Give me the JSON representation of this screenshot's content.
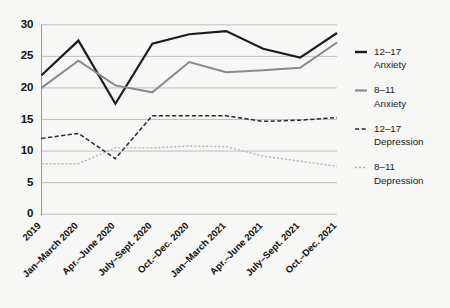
{
  "chart_data": {
    "type": "line",
    "title": "",
    "subtitle": "",
    "xlabel": "",
    "ylabel": "",
    "ylim": [
      0,
      30
    ],
    "yticks": [
      0,
      5,
      10,
      15,
      20,
      25,
      30
    ],
    "grid": true,
    "legend_position": "right",
    "categories": [
      "2019",
      "Jan–March 2020",
      "Apr.–June 2020",
      "July–Sept. 2020",
      "Oct.–Dec. 2020",
      "Jan–March 2021",
      "Apr.–June 2021",
      "July–Sept. 2021",
      "Oct.–Dec. 2021"
    ],
    "series": [
      {
        "name": "12–17 Anxiety",
        "legend_line1": "12–17",
        "legend_line2": "Anxiety",
        "color": "#1c1c1c",
        "style": "solid",
        "width": 2.2,
        "values": [
          22.0,
          27.5,
          17.5,
          27.0,
          28.5,
          29.0,
          26.2,
          24.8,
          28.7
        ]
      },
      {
        "name": "8–11 Anxiety",
        "legend_line1": "8–11",
        "legend_line2": "Anxiety",
        "color": "#8a8a8a",
        "style": "solid",
        "width": 2.0,
        "values": [
          20.0,
          24.3,
          20.4,
          19.3,
          24.1,
          22.5,
          22.8,
          23.2,
          27.2
        ]
      },
      {
        "name": "12–17 Depression",
        "legend_line1": "12–17",
        "legend_line2": "Depression",
        "color": "#2b2b2b",
        "style": "dashed",
        "width": 1.5,
        "values": [
          12.0,
          12.8,
          8.8,
          15.6,
          15.6,
          15.6,
          14.7,
          14.9,
          15.3
        ]
      },
      {
        "name": "8–11 Depression",
        "legend_line1": "8–11",
        "legend_line2": "Depression",
        "color": "#b4b4b4",
        "style": "dotted",
        "width": 1.4,
        "values": [
          8.0,
          8.0,
          10.5,
          10.5,
          10.8,
          10.7,
          9.2,
          8.4,
          7.6
        ]
      }
    ]
  },
  "colors": {
    "background": "#f7f7f5",
    "grid": "#b9b9b9",
    "axis": "#8c8c8c",
    "text": "#1a1a1a"
  }
}
